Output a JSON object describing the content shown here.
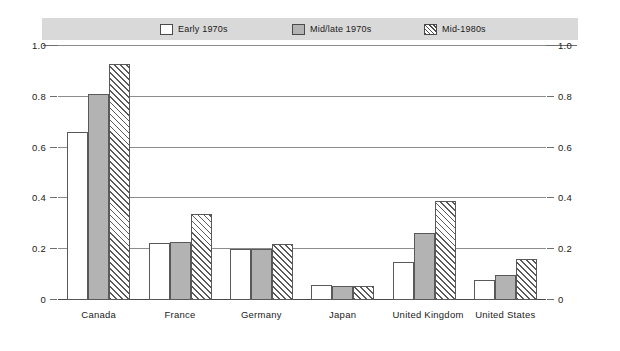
{
  "legend": {
    "items": [
      {
        "label": "Early 1970s",
        "swatch": "white-square-icon"
      },
      {
        "label": "Mid/late 1970s",
        "swatch": "gray-square-icon"
      },
      {
        "label": "Mid-1980s",
        "swatch": "hatched-square-icon"
      }
    ]
  },
  "axis": {
    "left_ticks": [
      "1.0",
      "0.8",
      "0.6",
      "0.4",
      "0.2",
      "0"
    ],
    "right_ticks": [
      "1.0",
      "0.8",
      "0.6",
      "0.4",
      "0.2",
      "0"
    ]
  },
  "chart_data": {
    "type": "bar",
    "title": "",
    "subtitle": "",
    "xlabel": "",
    "ylabel": "",
    "ylim": [
      0,
      1.0
    ],
    "yticks": [
      0,
      0.2,
      0.4,
      0.6,
      0.8,
      1.0
    ],
    "grid": true,
    "legend_position": "top",
    "categories": [
      "Canada",
      "France",
      "Germany",
      "Japan",
      "United Kingdom",
      "United States"
    ],
    "series": [
      {
        "name": "Early 1970s",
        "values": [
          0.66,
          0.225,
          0.2,
          0.06,
          0.15,
          0.08
        ]
      },
      {
        "name": "Mid/late 1970s",
        "values": [
          0.81,
          0.23,
          0.2,
          0.055,
          0.265,
          0.1
        ]
      },
      {
        "name": "Mid-1980s",
        "values": [
          0.93,
          0.34,
          0.22,
          0.055,
          0.39,
          0.16
        ]
      }
    ]
  },
  "colors": {
    "early": "#ffffff",
    "mid": "#b3b3b3",
    "late_hatch": "#595959",
    "legend_band": "#d9d9d9",
    "gridline": "#8c8c8c",
    "text": "#1a1a1a"
  }
}
